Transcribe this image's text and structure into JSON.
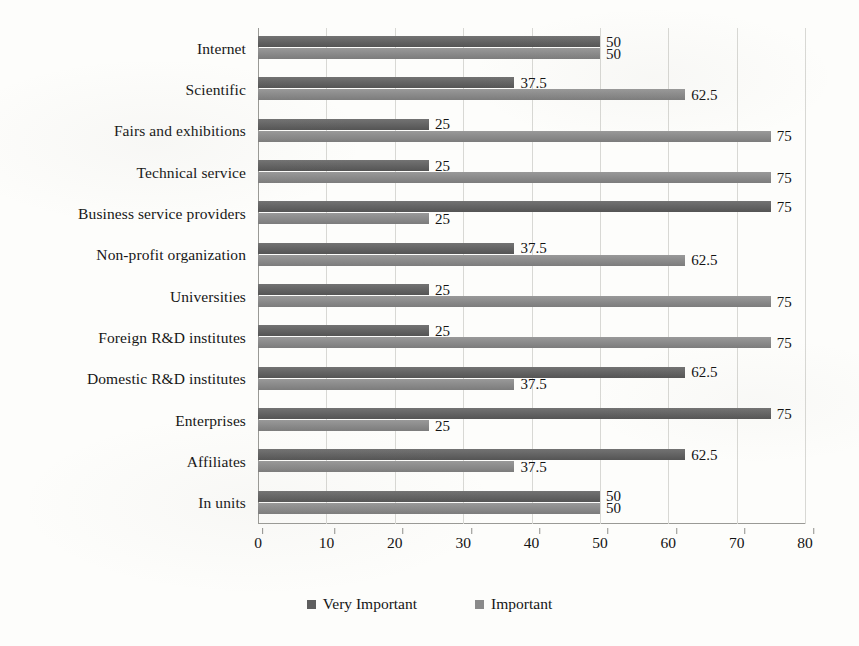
{
  "chart_data": {
    "type": "bar",
    "orientation": "horizontal",
    "title": "",
    "subtitle": "",
    "xlabel": "",
    "ylabel": "",
    "xlim": [
      0,
      80
    ],
    "xticks": [
      0,
      10,
      20,
      30,
      40,
      50,
      60,
      70,
      80
    ],
    "xtick_labels": [
      "0",
      "10",
      "20",
      "30",
      "40",
      "50",
      "60",
      "70",
      "80"
    ],
    "grid": true,
    "grid_axis": "x",
    "legend_position": "bottom",
    "categories": [
      "Internet",
      "Scientific",
      "Fairs and exhibitions",
      "Technical service",
      "Business service providers",
      "Non-profit organization",
      "Universities",
      "Foreign R&D institutes",
      "Domestic R&D institutes",
      "Enterprises",
      "Affiliates",
      "In units"
    ],
    "series": [
      {
        "name": "Very Important",
        "color": "#5e5e5e",
        "values": [
          50,
          37.5,
          25,
          25,
          75,
          37.5,
          25,
          25,
          62.5,
          75,
          62.5,
          50
        ],
        "labels": [
          "50",
          "37.5",
          "25",
          "25",
          "75",
          "37.5",
          "25",
          "25",
          "62.5",
          "75",
          "62.5",
          "50"
        ]
      },
      {
        "name": "Important",
        "color": "#8a8a8a",
        "values": [
          50,
          62.5,
          75,
          75,
          25,
          62.5,
          75,
          75,
          37.5,
          25,
          37.5,
          50
        ],
        "labels": [
          "50",
          "62.5",
          "75",
          "75",
          "25",
          "62.5",
          "75",
          "75",
          "37.5",
          "25",
          "37.5",
          "50"
        ]
      }
    ]
  },
  "legend": {
    "items": [
      {
        "label": "Very Important",
        "color": "#5e5e5e"
      },
      {
        "label": "Important",
        "color": "#8a8a8a"
      }
    ]
  }
}
